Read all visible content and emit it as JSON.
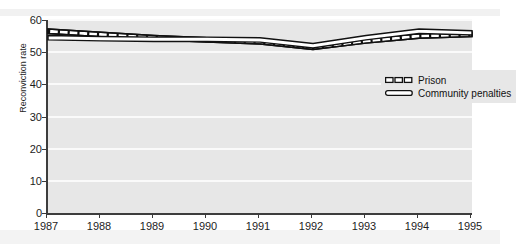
{
  "chart_data": {
    "type": "line",
    "title": "",
    "xlabel": "",
    "ylabel": "Reconviction rate",
    "categories": [
      "1987",
      "1988",
      "1989",
      "1990",
      "1991",
      "1992",
      "1993",
      "1994",
      "1995"
    ],
    "x": [
      1987,
      1988,
      1989,
      1990,
      1991,
      1992,
      1993,
      1994,
      1995
    ],
    "xlim": [
      1987,
      1995
    ],
    "ylim": [
      0,
      60
    ],
    "yticks": [
      0,
      10,
      20,
      30,
      40,
      50,
      60
    ],
    "grid": "horizontal",
    "legend_position": "upper-right-inside",
    "series": [
      {
        "name": "Prison",
        "style": "dashed",
        "values": [
          56.5,
          55.5,
          54.5,
          53.8,
          53.2,
          51.5,
          53.5,
          55.0,
          55.5
        ]
      },
      {
        "name": "Community penalties",
        "style": "solid",
        "values": [
          54.5,
          54.2,
          54.0,
          54.0,
          53.8,
          52.0,
          54.5,
          56.5,
          56.0
        ]
      }
    ]
  },
  "axes": {
    "y_label": "Reconviction rate",
    "y_tick_labels": [
      "0",
      "10",
      "20",
      "30",
      "40",
      "50",
      "60"
    ],
    "x_tick_labels": [
      "1987",
      "1988",
      "1989",
      "1990",
      "1991",
      "1992",
      "1993",
      "1994",
      "1995"
    ]
  },
  "legend": {
    "entries": [
      {
        "label": "Prison",
        "swatch": "dashed-ribbon-swatch"
      },
      {
        "label": "Community penalties",
        "swatch": "solid-ribbon-swatch"
      }
    ]
  },
  "colors": {
    "plot_background": "#e7e7e7",
    "page_background": "#ffffff",
    "gridline": "#fafafa",
    "axis": "#3d3d3d",
    "line_stroke": "#111111",
    "line_fill": "#ffffff",
    "text": "#1d1d1d"
  },
  "title_fragment": "y p"
}
